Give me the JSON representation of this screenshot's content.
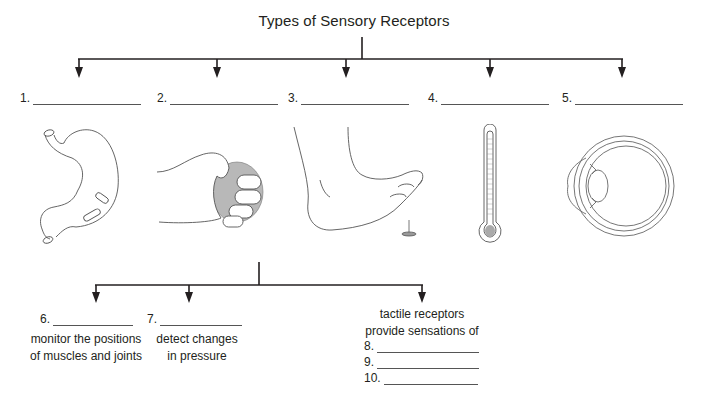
{
  "title": "Types of Sensory Receptors",
  "top_level": {
    "items": [
      {
        "number": "1.",
        "illustration": "stomach-with-pills"
      },
      {
        "number": "2.",
        "illustration": "hand-squeezing-ball"
      },
      {
        "number": "3.",
        "illustration": "foot-stepping-on-tack"
      },
      {
        "number": "4.",
        "illustration": "thermometer"
      },
      {
        "number": "5.",
        "illustration": "eye-cross-section"
      }
    ]
  },
  "sub_level": {
    "items": [
      {
        "number": "6.",
        "description_line1": "monitor the positions",
        "description_line2": "of muscles and joints"
      },
      {
        "number": "7.",
        "description_line1": "detect changes",
        "description_line2": "in pressure"
      },
      {
        "intro_line1": "tactile receptors",
        "intro_line2": "provide sensations of",
        "blanks": [
          {
            "number": "8."
          },
          {
            "number": "9."
          },
          {
            "number": "10."
          }
        ]
      }
    ]
  },
  "colors": {
    "line": "#231f20",
    "blank": "#555555",
    "ball_fill": "#b8b8b8"
  }
}
